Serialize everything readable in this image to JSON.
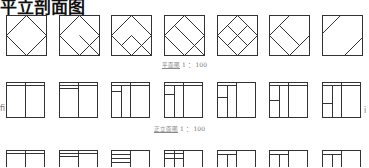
{
  "title": "平立剖面图",
  "plan_label": {
    "name": "平面图",
    "scale": "1 ： 100"
  },
  "elevation_label": {
    "name": "正立面图",
    "scale": "1 ： 100"
  },
  "side_left_glyph": "fi",
  "side_right_glyph": "i",
  "colors": {
    "stroke": "#333333",
    "label": "#777777"
  },
  "rows": [
    {
      "name": "plan-diagrams",
      "count": 7
    },
    {
      "name": "elevation-diagrams",
      "count": 7
    },
    {
      "name": "section-diagrams",
      "count": 7
    }
  ]
}
